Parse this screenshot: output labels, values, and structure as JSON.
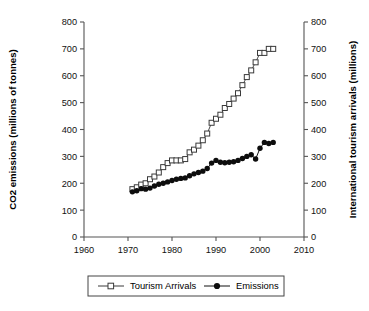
{
  "chart_data": {
    "type": "line",
    "title": "",
    "xlabel": "",
    "ylabel": "CO2 emissions (millions of tonnes)",
    "y2label": "International tourism arrivals (millions)",
    "xlim": [
      1960,
      2010
    ],
    "ylim": [
      0,
      800
    ],
    "y2lim": [
      0,
      800
    ],
    "xticks": [
      1960,
      1970,
      1980,
      1990,
      2000,
      2010
    ],
    "yticks": [
      0,
      100,
      200,
      300,
      400,
      500,
      600,
      700,
      800
    ],
    "y2ticks": [
      0,
      100,
      200,
      300,
      400,
      500,
      600,
      700,
      800
    ],
    "grid": false,
    "legend_position": "bottom",
    "x": [
      1971,
      1972,
      1973,
      1974,
      1975,
      1976,
      1977,
      1978,
      1979,
      1980,
      1981,
      1982,
      1983,
      1984,
      1985,
      1986,
      1987,
      1988,
      1989,
      1990,
      1991,
      1992,
      1993,
      1994,
      1995,
      1996,
      1997,
      1998,
      1999,
      2000,
      2001,
      2002,
      2003
    ],
    "series": [
      {
        "name": "Tourism Arrivals",
        "marker": "open-square",
        "values": [
          178,
          185,
          195,
          200,
          215,
          225,
          240,
          260,
          275,
          285,
          285,
          285,
          290,
          315,
          325,
          340,
          360,
          385,
          425,
          440,
          455,
          480,
          495,
          515,
          535,
          565,
          595,
          620,
          650,
          685,
          685,
          700,
          700
        ]
      },
      {
        "name": "Emissions",
        "marker": "filled-circle",
        "values": [
          168,
          172,
          180,
          178,
          182,
          190,
          196,
          200,
          205,
          210,
          215,
          218,
          220,
          228,
          235,
          240,
          245,
          255,
          275,
          285,
          278,
          276,
          278,
          280,
          285,
          292,
          300,
          306,
          290,
          330,
          352,
          348,
          352
        ]
      }
    ]
  },
  "legend": {
    "items": [
      {
        "label": "Tourism Arrivals",
        "marker": "open-square"
      },
      {
        "label": "Emissions",
        "marker": "filled-circle"
      }
    ]
  }
}
